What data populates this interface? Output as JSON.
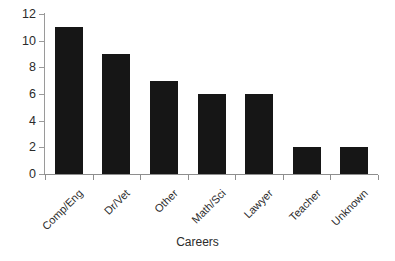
{
  "chart_data": {
    "type": "bar",
    "title": "",
    "subtitle": "",
    "xlabel": "Careers",
    "ylabel": "",
    "categories": [
      "Comp/Eng",
      "Dr/Vet",
      "Other",
      "Math/Sci",
      "Lawyer",
      "Teacher",
      "Unknown"
    ],
    "values": [
      11,
      9,
      7,
      6,
      6,
      2,
      2
    ],
    "ylim": [
      0,
      12
    ],
    "yticks": [
      0,
      2,
      4,
      6,
      8,
      10,
      12
    ],
    "ytick_labels": [
      "0",
      "2",
      "4",
      "6",
      "8",
      "10",
      "12"
    ],
    "grid": false,
    "legend": null,
    "legend_position": "none",
    "bar_color": "#161616",
    "axis_color": "#8e8e8e",
    "background_color": "#ffffff",
    "text_color": "#2b2b2b",
    "xlabel_rotation_deg": -45
  }
}
